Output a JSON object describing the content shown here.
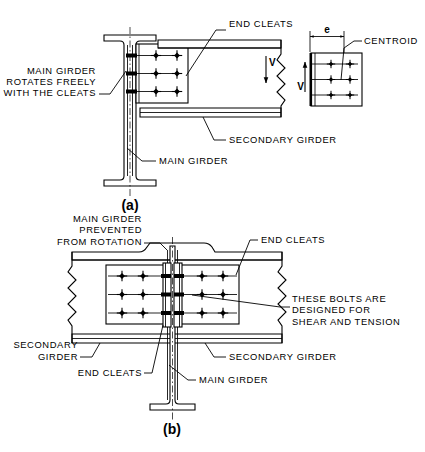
{
  "figure": {
    "line_color": "#000000",
    "background_color": "#ffffff",
    "panels": [
      {
        "caption": "(a)",
        "description": "Flexible end cleat connection — main girder rotates freely with the cleats",
        "labels": [
          {
            "id": "end-cleats-a",
            "text": "END CLEATS"
          },
          {
            "id": "main-rotates",
            "lines": [
              "MAIN GIRDER",
              "ROTATES FREELY",
              "WITH THE CLEATS"
            ]
          },
          {
            "id": "secondary-a",
            "text": "SECONDARY GIRDER"
          },
          {
            "id": "main-girder-a",
            "text": "MAIN GIRDER"
          }
        ],
        "force_symbol": "V"
      },
      {
        "caption": "(b)",
        "description": "Rigid end cleat connection — main girder prevented from rotation",
        "labels": [
          {
            "id": "main-prevented",
            "lines": [
              "MAIN GIRDER",
              "PREVENTED",
              "FROM ROTATION"
            ]
          },
          {
            "id": "end-cleats-b-top",
            "text": "END CLEATS"
          },
          {
            "id": "bolts-note",
            "lines": [
              "THESE BOLTS ARE",
              "DESIGNED FOR",
              "SHEAR AND TENSION"
            ]
          },
          {
            "id": "secondary-b-left",
            "lines": [
              "SECONDARY",
              "GIRDER"
            ]
          },
          {
            "id": "secondary-b-right",
            "text": "SECONDARY GIRDER"
          },
          {
            "id": "end-cleats-b-bottom",
            "text": "END CLEATS"
          },
          {
            "id": "main-girder-b",
            "text": "MAIN GIRDER"
          }
        ]
      }
    ],
    "detail_view": {
      "id": "bolt-group-detail",
      "dimension_label": "e",
      "centroid_label": "CENTROID",
      "force_symbol": "V",
      "bolt_columns": 2,
      "bolt_rows": 3
    },
    "bolt_group": {
      "rows": 3,
      "columns": 2,
      "symbol": "cross-bolt"
    }
  }
}
